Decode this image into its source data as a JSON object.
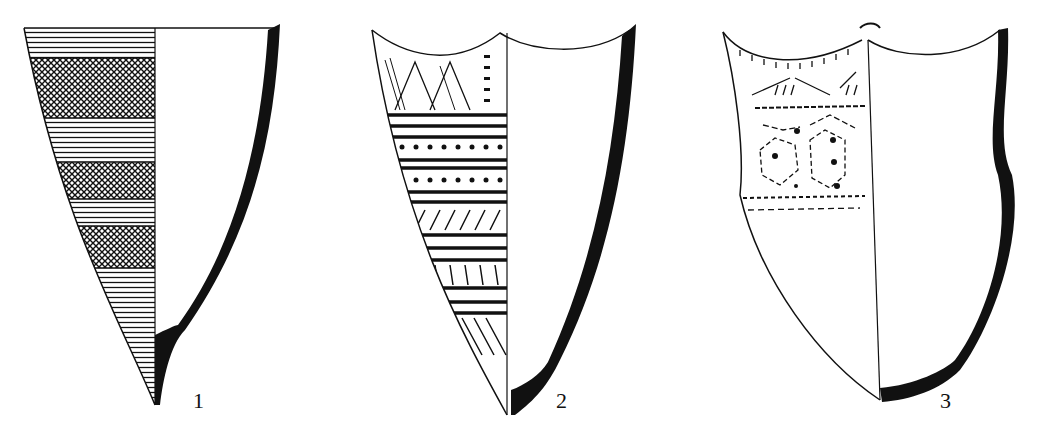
{
  "figure": {
    "type": "archaeological pottery drawing",
    "background": "#ffffff",
    "ink": "#111111",
    "vessels": [
      {
        "label": "1",
        "shape": "conical pointed-base vessel, flat rim",
        "decoration": [
          "horizontal line bands",
          "cross-hatched bands",
          "horizontal line bands",
          "cross-hatched band",
          "horizontal lines",
          "cross-hatched band",
          "horizontal lines to base"
        ]
      },
      {
        "label": "2",
        "shape": "conical pointed-base vessel, scalloped rim",
        "decoration": [
          "zigzag triangles",
          "dotted column",
          "thick horizontal lines",
          "crescent impressions row",
          "crescent impressions row",
          "oblique short strokes",
          "vertical short strokes",
          "diagonal lines at base"
        ]
      },
      {
        "label": "3",
        "shape": "rounded-base vessel with lugs, scalloped rim",
        "decoration": [
          "rim tick marks",
          "chevron strokes",
          "dashed line",
          "dotted-dash hexagon motifs with central dots",
          "dashed horizontal band"
        ]
      }
    ]
  }
}
